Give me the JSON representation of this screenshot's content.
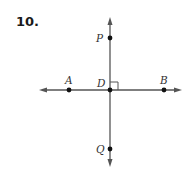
{
  "problem": {
    "number": "10."
  },
  "colors": {
    "line": "#555555",
    "point": "#111111",
    "label": "#333333"
  },
  "diagram": {
    "points": [
      {
        "name": "P",
        "label": "P",
        "x": 110,
        "y": 38,
        "lx": 98,
        "ly": 42
      },
      {
        "name": "A",
        "label": "A",
        "x": 69,
        "y": 90,
        "lx": 66,
        "ly": 84
      },
      {
        "name": "D",
        "label": "D",
        "x": 110,
        "y": 90,
        "lx": 96,
        "ly": 88
      },
      {
        "name": "B",
        "label": "B",
        "x": 164,
        "y": 90,
        "lx": 161,
        "ly": 84
      },
      {
        "name": "Q",
        "label": "Q",
        "x": 110,
        "y": 149,
        "lx": 96,
        "ly": 154
      }
    ],
    "lines": [
      {
        "name": "line-PQ",
        "from": "P",
        "to": "Q",
        "orientation": "vertical"
      },
      {
        "name": "line-AB",
        "from": "A",
        "to": "B",
        "orientation": "horizontal"
      }
    ],
    "right_angle_at": "D"
  }
}
